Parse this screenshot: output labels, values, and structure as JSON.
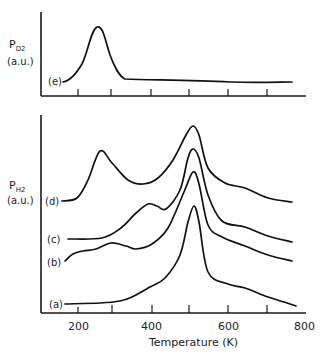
{
  "figure": {
    "top_panel": {
      "ylabel_main": "P",
      "ylabel_sub": "D2",
      "ylabel_units": "(a.u.)"
    },
    "bottom_panel": {
      "ylabel_main": "P",
      "ylabel_sub": "H2",
      "ylabel_units": "(a.u.)"
    },
    "xlabel": "Temperature (K)",
    "xtick_labels": [
      "200",
      "400",
      "600",
      "800"
    ]
  },
  "chart_data": [
    {
      "type": "line",
      "title": "",
      "panel": "top",
      "xlabel": "",
      "ylabel": "P_D2 (a.u.)",
      "xlim": [
        100,
        800
      ],
      "xticks": [
        200,
        300,
        400,
        500,
        600,
        700
      ],
      "grid": false,
      "series": [
        {
          "name": "(e)",
          "x": [
            160,
            190,
            220,
            245,
            258,
            270,
            290,
            320,
            360,
            450,
            550,
            650,
            760
          ],
          "y": [
            0.05,
            0.2,
            0.55,
            0.95,
            1.0,
            0.85,
            0.35,
            0.1,
            0.08,
            0.07,
            0.04,
            0.04,
            0.04
          ]
        }
      ]
    },
    {
      "type": "line",
      "title": "",
      "panel": "bottom",
      "xlabel": "Temperature (K)",
      "ylabel": "P_H2 (a.u.)",
      "xlim": [
        100,
        800
      ],
      "xticks": [
        200,
        300,
        400,
        500,
        600,
        700,
        800
      ],
      "grid": false,
      "series": [
        {
          "name": "(d)",
          "x": [
            160,
            200,
            230,
            260,
            290,
            330,
            370,
            410,
            450,
            485,
            505,
            520,
            545,
            590,
            640,
            700,
            760
          ],
          "px": [
            62,
            77,
            88,
            100,
            112,
            128,
            143,
            158,
            173,
            186,
            193,
            199,
            208,
            225,
            245,
            268,
            292
          ],
          "py": [
            201,
            198,
            180,
            151,
            163,
            180,
            184,
            178,
            160,
            135,
            126,
            135,
            168,
            183,
            188,
            198,
            202
          ]
        },
        {
          "name": "(c)",
          "x": [
            165,
            250,
            300,
            340,
            375,
            400,
            425,
            460,
            490,
            505,
            520,
            545,
            580,
            640,
            700,
            760
          ],
          "px": [
            68,
            102,
            121,
            136,
            148,
            157,
            166,
            180,
            188,
            193,
            199,
            208,
            222,
            245,
            268,
            292
          ],
          "py": [
            239,
            238,
            228,
            213,
            204,
            206,
            209,
            190,
            158,
            149,
            158,
            195,
            221,
            227,
            236,
            242
          ]
        },
        {
          "name": "(b)",
          "x": [
            160,
            190,
            230,
            260,
            290,
            330,
            365,
            400,
            440,
            480,
            505,
            520,
            545,
            580,
            640,
            700,
            760
          ],
          "px": [
            65,
            73,
            83,
            96,
            111,
            126,
            136,
            152,
            168,
            184,
            193,
            199,
            208,
            222,
            245,
            268,
            292
          ],
          "py": [
            261,
            254,
            251,
            249,
            243,
            246,
            249,
            244,
            228,
            192,
            172,
            184,
            225,
            237,
            246,
            255,
            261
          ]
        },
        {
          "name": "(a)",
          "x": [
            160,
            250,
            300,
            330,
            380,
            420,
            460,
            490,
            510,
            525,
            545,
            600,
            650,
            700,
            740,
            770
          ],
          "px": [
            65,
            100,
            120,
            132,
            150,
            165,
            180,
            188,
            194,
            199,
            208,
            228,
            245,
            268,
            284,
            296
          ],
          "py": [
            304,
            303,
            301,
            297,
            287,
            278,
            255,
            222,
            206,
            222,
            272,
            284,
            288,
            297,
            302,
            306
          ]
        }
      ]
    }
  ]
}
